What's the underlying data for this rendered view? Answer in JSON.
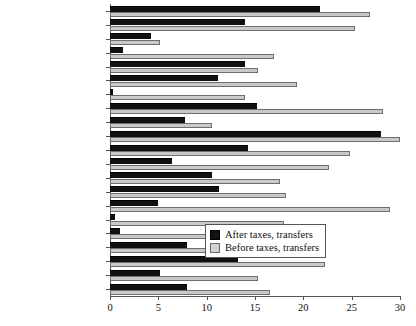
{
  "chart_data": {
    "type": "bar",
    "orientation": "horizontal",
    "title": "",
    "xlabel": "",
    "ylabel": "",
    "xlim": [
      0,
      30
    ],
    "xticks": [
      0,
      5,
      10,
      15,
      20,
      25,
      30
    ],
    "grid": false,
    "legend_position": "inside-right-lower",
    "categories": [
      "US",
      "UK",
      "Switzerland",
      "Sweden",
      "Portugal",
      "Poland",
      "Norway",
      "New Zealand",
      "Netherlands",
      "Mexico",
      "Ireland",
      "Hungary",
      "Greece",
      "Germany",
      "France",
      "Finland",
      "Denmark",
      "Czech Republic",
      "Canada",
      "Belgium",
      "Austria"
    ],
    "series": [
      {
        "name": "After taxes, transfers",
        "color": "#111111",
        "values": [
          21.7,
          14.0,
          4.2,
          1.3,
          14.0,
          11.2,
          0.3,
          15.2,
          7.8,
          28.0,
          14.3,
          6.4,
          10.6,
          11.3,
          5.0,
          0.5,
          1.0,
          8.0,
          13.2,
          5.2,
          8.0
        ]
      },
      {
        "name": "Before taxes, transfers",
        "color": "#c9c9c9",
        "values": [
          26.9,
          25.3,
          5.2,
          17.0,
          15.3,
          19.3,
          14.0,
          28.2,
          10.6,
          30.0,
          24.8,
          22.7,
          17.6,
          18.2,
          29.0,
          18.0,
          17.0,
          21.3,
          22.2,
          15.3,
          16.5
        ]
      }
    ]
  },
  "legend": {
    "items": [
      {
        "label": "After taxes, transfers",
        "swatch": "black-square"
      },
      {
        "label": "Before taxes, transfers",
        "swatch": "light-gray-square"
      }
    ]
  },
  "axis": {
    "x_tick_labels": [
      "0",
      "5",
      "10",
      "15",
      "20",
      "25",
      "30"
    ]
  },
  "colors": {
    "after": "#111111",
    "before": "#c9c9c9",
    "axis": "#555555",
    "text": "#111111",
    "background": "#ffffff"
  }
}
